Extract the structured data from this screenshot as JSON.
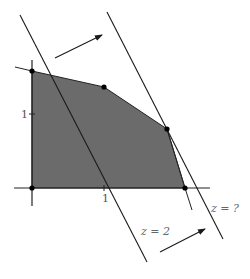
{
  "diagram": {
    "type": "linear-programming-feasible-region",
    "colors": {
      "region_fill": "#6b6b6b",
      "line": "#1a1a1a",
      "axis": "#222222",
      "vertex": "#000000",
      "label": "#555555",
      "background": "#ffffff"
    },
    "axes": {
      "x_tick_label": "1",
      "y_tick_label": "1"
    },
    "vertices": [
      {
        "name": "origin",
        "px": [
          32,
          188
        ]
      },
      {
        "name": "y-intercept",
        "px": [
          32,
          71
        ]
      },
      {
        "name": "upper-vertex",
        "px": [
          104,
          87
        ]
      },
      {
        "name": "optimal-vertex",
        "px": [
          167,
          129
        ]
      },
      {
        "name": "x-intercept",
        "px": [
          185,
          188
        ]
      }
    ],
    "objective_lines": [
      {
        "label": "z = 2",
        "from": [
          20,
          15
        ],
        "to": [
          147,
          262
        ]
      },
      {
        "label": "z = ?",
        "from": [
          107,
          12
        ],
        "to": [
          223,
          239
        ]
      }
    ],
    "arrows": [
      {
        "name": "direction-arrow-top",
        "from": [
          55,
          58
        ],
        "to": [
          102,
          35
        ]
      },
      {
        "name": "direction-arrow-bottom",
        "from": [
          160,
          252
        ],
        "to": [
          205,
          229
        ]
      }
    ],
    "labels": {
      "z_equals_2": "z = 2",
      "z_equals_unknown": "z = ?"
    }
  }
}
